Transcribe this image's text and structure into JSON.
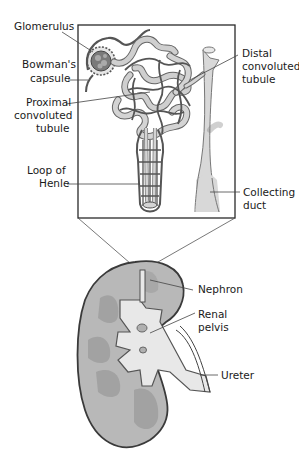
{
  "diagram": {
    "colors": {
      "outline": "#3a3a3a",
      "tubule": "#cfcfcf",
      "vessel": "#6e6e6e",
      "cortex": "#b8b8b8",
      "pyramid": "#a2a2a2",
      "pelvis": "#e8e8e8",
      "line": "#444444"
    },
    "nephron_labels": {
      "glomerulus": "Glomerulus",
      "bowmans_1": "Bowman's",
      "bowmans_2": "capsule",
      "proximal_1": "Proximal",
      "proximal_2": "convoluted",
      "proximal_3": "tubule",
      "loop_1": "Loop of",
      "loop_2": "Henle",
      "distal_1": "Distal",
      "distal_2": "convoluted",
      "distal_3": "tubule",
      "collecting_1": "Collecting",
      "collecting_2": "duct"
    },
    "kidney_labels": {
      "nephron": "Nephron",
      "renal_1": "Renal",
      "renal_2": "pelvis",
      "ureter": "Ureter"
    }
  }
}
